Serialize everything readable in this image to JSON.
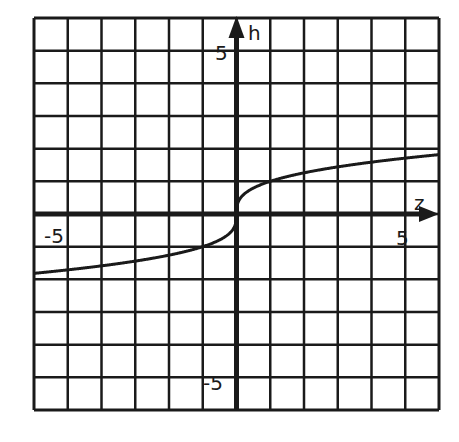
{
  "chart_data": {
    "type": "line",
    "title": "",
    "xlabel": "z",
    "ylabel": "h",
    "xlim": [
      -6,
      6
    ],
    "ylim": [
      -6,
      6
    ],
    "grid": true,
    "grid_step": 1,
    "tick_labels": {
      "x": [
        {
          "value": -5,
          "label": "-5"
        },
        {
          "value": 5,
          "label": "5"
        }
      ],
      "y": [
        {
          "value": 5,
          "label": "5"
        },
        {
          "value": -5,
          "label": "-5"
        }
      ]
    },
    "series": [
      {
        "name": "h = cube root of z",
        "x": [
          -6,
          -5,
          -4,
          -3,
          -2,
          -1,
          -0.5,
          -0.1,
          0,
          0.1,
          0.5,
          1,
          2,
          3,
          4,
          5,
          6
        ],
        "y": [
          -1.82,
          -1.71,
          -1.59,
          -1.44,
          -1.26,
          -1.0,
          -0.79,
          -0.46,
          0,
          0.46,
          0.79,
          1.0,
          1.26,
          1.44,
          1.59,
          1.71,
          1.82
        ]
      }
    ],
    "colors": {
      "grid": "#1a1a1a",
      "curve": "#1a1a1a",
      "background": "#ffffff"
    }
  },
  "labels": {
    "x_axis": "z",
    "y_axis": "h",
    "x_neg": "-5",
    "x_pos": "5",
    "y_pos": "5",
    "y_neg": "-5"
  }
}
